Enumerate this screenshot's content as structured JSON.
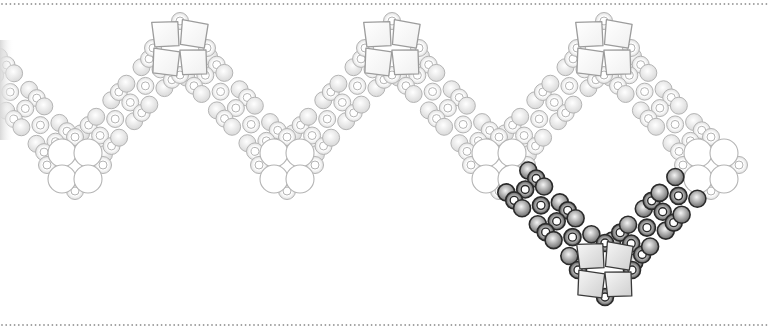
{
  "diagram": {
    "type": "beadwork-pattern",
    "width": 768,
    "height": 334,
    "border": {
      "top_y": 4,
      "bottom_y": 325,
      "dot_spacing": 4.2,
      "dot_radius": 0.9,
      "color": "#9a9a9a"
    },
    "colors": {
      "faded_stroke": "#b4b4b4",
      "faded_fill_light": "#ffffff",
      "faded_fill_dark": "#d6d6d6",
      "active_stroke": "#2a2a2a",
      "active_fill_light": "#f2f2f2",
      "active_fill_dark": "#7a7a7a",
      "cube_fill_faded": "#fbfbfb",
      "cube_fill_active": "#e4e4e4"
    },
    "geometry": {
      "period": 212,
      "top_y": 48,
      "bottom_y": 163,
      "first_bottom_x": 75,
      "round_bead_r": 8.5,
      "ring_bead_r": 8.5,
      "ring_hole_r": 4,
      "large_bead_r": 14,
      "cube_half": 13,
      "band_spacing": 15.5
    },
    "components": {
      "top_clusters": [
        {
          "id": "cube-cluster-1",
          "x": 180,
          "y": 48,
          "state": "faded"
        },
        {
          "id": "cube-cluster-2",
          "x": 392,
          "y": 48,
          "state": "faded"
        },
        {
          "id": "cube-cluster-3",
          "x": 604,
          "y": 48,
          "state": "faded"
        }
      ],
      "bottom_clusters": [
        {
          "id": "round-cluster-1",
          "x": 75,
          "y": 163,
          "state": "faded"
        },
        {
          "id": "round-cluster-2",
          "x": 287,
          "y": 163,
          "state": "faded"
        },
        {
          "id": "round-cluster-3",
          "x": 499,
          "y": 163,
          "state": "faded"
        },
        {
          "id": "round-cluster-4",
          "x": 711,
          "y": 163,
          "state": "faded"
        }
      ],
      "active_cluster": {
        "id": "cube-cluster-active",
        "x": 605,
        "y": 270,
        "state": "active"
      },
      "bands": [
        {
          "id": "band-1",
          "from": [
            -30,
            48
          ],
          "to": [
            75,
            163
          ],
          "state": "faded"
        },
        {
          "id": "band-2",
          "from": [
            75,
            163
          ],
          "to": [
            180,
            48
          ],
          "state": "faded"
        },
        {
          "id": "band-3",
          "from": [
            180,
            48
          ],
          "to": [
            287,
            163
          ],
          "state": "faded"
        },
        {
          "id": "band-4",
          "from": [
            287,
            163
          ],
          "to": [
            392,
            48
          ],
          "state": "faded"
        },
        {
          "id": "band-5",
          "from": [
            392,
            48
          ],
          "to": [
            499,
            163
          ],
          "state": "faded"
        },
        {
          "id": "band-6",
          "from": [
            499,
            163
          ],
          "to": [
            604,
            48
          ],
          "state": "faded"
        },
        {
          "id": "band-7",
          "from": [
            604,
            48
          ],
          "to": [
            711,
            163
          ],
          "state": "faded"
        },
        {
          "id": "band-8",
          "from": [
            499,
            163
          ],
          "to": [
            605,
            270
          ],
          "state": "active"
        },
        {
          "id": "band-9",
          "from": [
            605,
            270
          ],
          "to": [
            711,
            163
          ],
          "state": "active"
        }
      ]
    },
    "legend": {
      "faded": "completed section (light)",
      "active": "current step (dark)"
    }
  }
}
